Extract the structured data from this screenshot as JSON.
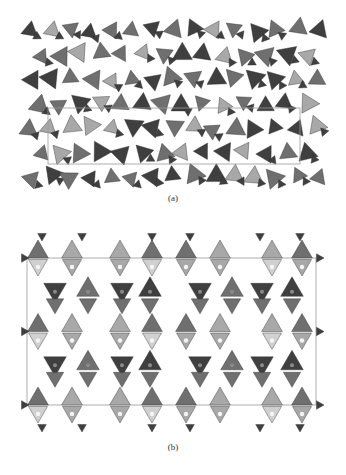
{
  "figure": {
    "panels": [
      {
        "label": "(a)",
        "description": "Crystal structure framework view of corner-sharing tetrahedra (projection 1)",
        "unit_cell": {
          "x": 48,
          "y": 108,
          "w": 252,
          "h": 56
        },
        "extent": {
          "x": 22,
          "y": 22,
          "w": 304,
          "h": 170
        }
      },
      {
        "label": "(b)",
        "description": "Crystal structure framework view of corner-sharing tetrahedra (projection 2) with unit cell outline",
        "unit_cell": {
          "x": 27,
          "y": 48,
          "w": 289,
          "h": 147
        },
        "extent": {
          "x": 20,
          "y": 18,
          "w": 305,
          "h": 207
        }
      }
    ]
  },
  "colors": {
    "dark": "#3f3f3f",
    "mid": "#6f6f6f",
    "light": "#a8a8a8",
    "pale": "#d0d0d0",
    "cell": "#9a9a9a"
  }
}
